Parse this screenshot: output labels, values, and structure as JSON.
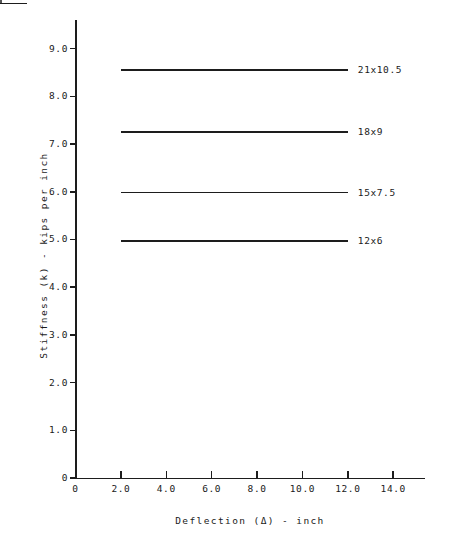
{
  "chart_data": {
    "type": "line",
    "title": "",
    "xlabel": "Deflection (Δ) - inch",
    "ylabel": "Stiffness (k) - kips per inch",
    "xlim": [
      0,
      15.4
    ],
    "ylim": [
      0,
      9.6
    ],
    "grid": false,
    "legend_position": "right-inline-labels",
    "x_ticks": [
      "0",
      "2.0",
      "4.0",
      "6.0",
      "8.0",
      "10.0",
      "12.0",
      "14.0"
    ],
    "x_tick_values": [
      0,
      2.0,
      4.0,
      6.0,
      8.0,
      10.0,
      12.0,
      14.0
    ],
    "y_ticks": [
      "0",
      "1.0",
      "2.0",
      "3.0",
      "4.0",
      "5.0",
      "6.0",
      "7.0",
      "8.0",
      "9.0"
    ],
    "y_tick_values": [
      0,
      1.0,
      2.0,
      3.0,
      4.0,
      5.0,
      6.0,
      7.0,
      8.0,
      9.0
    ],
    "series": [
      {
        "name": "21x10.5",
        "value": 8.55,
        "x_start": 2.0,
        "x_end": 12.0,
        "values": [
          8.55,
          8.55
        ]
      },
      {
        "name": "18x9",
        "value": 7.25,
        "x_start": 2.0,
        "x_end": 12.0,
        "values": [
          7.25,
          7.25
        ]
      },
      {
        "name": "15x7.5",
        "value": 5.98,
        "x_start": 2.0,
        "x_end": 12.0,
        "values": [
          5.98,
          5.98
        ]
      },
      {
        "name": "12x6",
        "value": 4.97,
        "x_start": 2.0,
        "x_end": 12.0,
        "values": [
          4.97,
          4.97
        ]
      }
    ]
  }
}
